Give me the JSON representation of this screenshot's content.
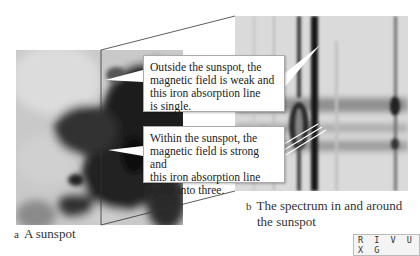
{
  "figure": {
    "panel_a": {
      "letter": "a",
      "caption": "A sunspot"
    },
    "panel_b": {
      "letter": "b",
      "caption_line1": "The spectrum in and around",
      "caption_line2": "the sunspot"
    },
    "callouts": [
      {
        "lines": [
          "Outside the sunspot, the",
          "magnetic field is weak and",
          "this iron absorption line",
          "is single."
        ]
      },
      {
        "lines": [
          "Within the sunspot, the",
          "magnetic field is strong and",
          "this iron absorption line",
          "splits into three."
        ]
      }
    ],
    "wavelength_band_label": "R I V U X G",
    "colors": {
      "background": "#ffffff",
      "callout_border": "#aaaaaa",
      "text": "#222222"
    }
  }
}
